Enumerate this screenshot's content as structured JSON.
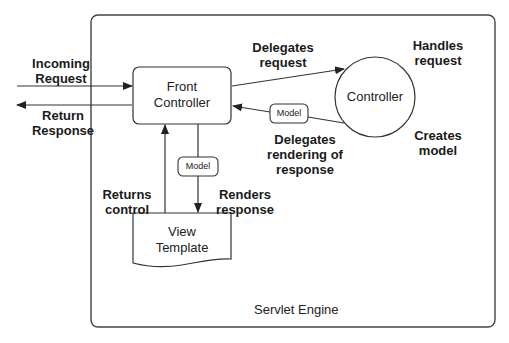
{
  "diagram": {
    "container": {
      "label": "Servlet Engine"
    },
    "nodes": {
      "front_controller": {
        "line1": "Front",
        "line2": "Controller"
      },
      "controller": {
        "label": "Controller"
      },
      "view_template": {
        "line1": "View",
        "line2": "Template"
      },
      "model_upper": {
        "label": "Model"
      },
      "model_lower": {
        "label": "Model"
      }
    },
    "edge_labels": {
      "incoming_request": {
        "line1": "Incoming",
        "line2": "Request"
      },
      "return_response": {
        "line1": "Return",
        "line2": "Response"
      },
      "delegates_request": {
        "line1": "Delegates",
        "line2": "request"
      },
      "delegates_rendering": {
        "line1": "Delegates",
        "line2": "rendering of",
        "line3": "response"
      },
      "renders_response": {
        "line1": "Renders",
        "line2": "response"
      },
      "returns_control": {
        "line1": "Returns",
        "line2": "control"
      }
    },
    "annotations": {
      "handles_request": {
        "line1": "Handles",
        "line2": "request"
      },
      "creates_model": {
        "line1": "Creates",
        "line2": "model"
      }
    },
    "colors": {
      "stroke": "#333333",
      "background": "#ffffff",
      "text": "#1a1a1a"
    }
  }
}
